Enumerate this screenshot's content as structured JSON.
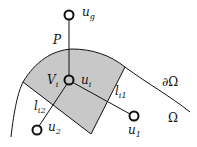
{
  "diagram": {
    "colors": {
      "cell_fill": "#c8c8c8",
      "stroke": "#111111",
      "background": "#ffffff"
    },
    "nodes": [
      {
        "id": "u_g",
        "label": "u",
        "sub": "g",
        "cx": 69,
        "cy": 15
      },
      {
        "id": "u_i",
        "label": "u",
        "sub": "i",
        "cx": 69,
        "cy": 80
      },
      {
        "id": "u_1",
        "label": "u",
        "sub": "1",
        "cx": 134,
        "cy": 116
      },
      {
        "id": "u_2",
        "label": "u",
        "sub": "2",
        "cx": 37,
        "cy": 130
      }
    ],
    "labels": {
      "P": "P",
      "V_i": "V",
      "V_i_sub": "i",
      "l_i1": "l",
      "l_i1_sub": "i1",
      "l_i2": "l",
      "l_i2_sub": "i2",
      "boundary": "∂Ω",
      "domain": "Ω"
    }
  }
}
